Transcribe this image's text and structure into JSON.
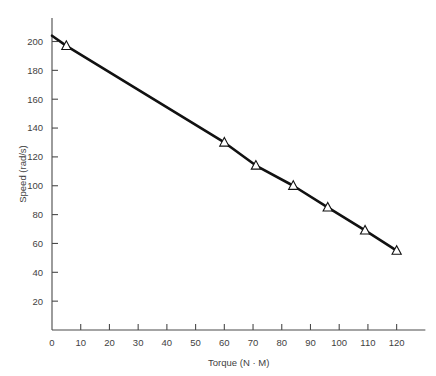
{
  "chart_data": {
    "type": "line",
    "title": "",
    "xlabel": "Torque (N · M)",
    "ylabel": "Speed (rad/s)",
    "xlim": [
      0,
      130
    ],
    "ylim": [
      0,
      210
    ],
    "grid": false,
    "legend": null,
    "marker": "triangle-up",
    "line_color": "#111111",
    "marker_fill": "#ffffff",
    "xticks": [
      0,
      10,
      20,
      30,
      40,
      50,
      60,
      70,
      80,
      90,
      100,
      110,
      120
    ],
    "xtick_labels": [
      "0",
      "10",
      "20",
      "30",
      "40",
      "50",
      "60",
      "70",
      "80",
      "90",
      "100",
      "110",
      "120"
    ],
    "yticks": [
      20,
      40,
      60,
      80,
      100,
      120,
      140,
      160,
      180,
      200
    ],
    "ytick_labels": [
      "20",
      "40",
      "60",
      "80",
      "100",
      "120",
      "140",
      "160",
      "180",
      "200"
    ],
    "series": [
      {
        "name": "Speed vs Torque",
        "x": [
          0,
          5,
          60,
          71,
          84,
          96,
          109,
          120
        ],
        "y": [
          204,
          197,
          130,
          114,
          100,
          85,
          69,
          55
        ],
        "markers_at": [
          {
            "x": 5,
            "y": 197
          },
          {
            "x": 60,
            "y": 130
          },
          {
            "x": 71,
            "y": 114
          },
          {
            "x": 84,
            "y": 100
          },
          {
            "x": 96,
            "y": 85
          },
          {
            "x": 109,
            "y": 69
          },
          {
            "x": 120,
            "y": 55
          }
        ]
      }
    ]
  }
}
